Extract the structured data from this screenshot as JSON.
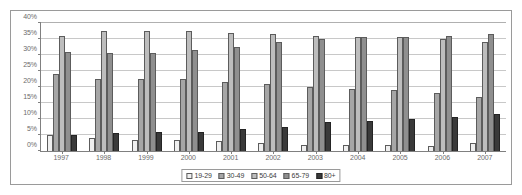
{
  "chart_data": {
    "type": "bar",
    "title": "",
    "subtitle": "",
    "xlabel": "",
    "ylabel": "",
    "ylim": [
      0,
      40
    ],
    "ytick_labels": [
      "0%",
      "5%",
      "10%",
      "15%",
      "20%",
      "25%",
      "30%",
      "35%",
      "40%"
    ],
    "ytick_values": [
      0,
      5,
      10,
      15,
      20,
      25,
      30,
      35,
      40
    ],
    "grid": true,
    "legend_position": "bottom-center",
    "categories": [
      "1997",
      "1998",
      "1999",
      "2000",
      "2001",
      "2002",
      "2003",
      "2004",
      "2005",
      "2006",
      "2007"
    ],
    "series": [
      {
        "name": "19-29",
        "color": "#efefef",
        "values": [
          5.0,
          4.0,
          3.5,
          3.5,
          3.0,
          2.5,
          2.0,
          2.0,
          2.0,
          1.5,
          2.5
        ]
      },
      {
        "name": "30-49",
        "color": "#a6a6a6",
        "values": [
          24.0,
          22.5,
          22.5,
          22.5,
          21.5,
          21.0,
          20.0,
          19.5,
          19.0,
          18.0,
          17.0
        ]
      },
      {
        "name": "50-64",
        "color": "#bdbdbd",
        "values": [
          36.0,
          37.5,
          37.5,
          37.5,
          37.0,
          36.5,
          36.0,
          35.5,
          35.5,
          35.0,
          34.0
        ]
      },
      {
        "name": "65-79",
        "color": "#8f8f8f",
        "values": [
          31.0,
          30.5,
          30.5,
          31.5,
          32.5,
          34.0,
          35.0,
          35.5,
          35.5,
          36.0,
          36.5
        ]
      },
      {
        "name": "80+",
        "color": "#3a3a3a",
        "values": [
          5.0,
          5.5,
          6.0,
          6.0,
          7.0,
          7.5,
          9.0,
          9.5,
          10.0,
          10.5,
          11.5
        ]
      }
    ]
  },
  "legend": {
    "items": [
      {
        "label": "19-29"
      },
      {
        "label": "30-49"
      },
      {
        "label": "50-64"
      },
      {
        "label": "65-79"
      },
      {
        "label": "80+"
      }
    ]
  }
}
